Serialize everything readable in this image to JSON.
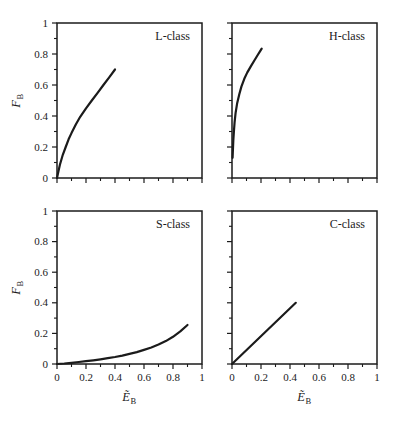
{
  "figure": {
    "background": "#ffffff",
    "ink_color": "#1b1b1b",
    "axis": {
      "x_letter": "Ẽ",
      "x_sub": "B",
      "y_letter": "F",
      "y_sub": "B"
    },
    "tick_values": [
      0,
      0.2,
      0.4,
      0.6,
      0.8,
      1
    ],
    "tick_labels": [
      "0",
      "0.2",
      "0.4",
      "0.6",
      "0.8",
      "1"
    ],
    "minor_tick_step": 0.1
  },
  "chart_data": [
    {
      "type": "line",
      "label": "L-class",
      "position": "top-left",
      "xlabel": "Ẽ_B",
      "ylabel": "F_B",
      "xlim": [
        0,
        1
      ],
      "ylim": [
        0,
        1
      ],
      "show_x_tick_labels": false,
      "show_y_tick_labels": true,
      "grid": false,
      "points": [
        [
          0,
          0
        ],
        [
          0.01,
          0.045
        ],
        [
          0.02,
          0.085
        ],
        [
          0.04,
          0.15
        ],
        [
          0.06,
          0.2
        ],
        [
          0.08,
          0.25
        ],
        [
          0.1,
          0.29
        ],
        [
          0.13,
          0.345
        ],
        [
          0.16,
          0.395
        ],
        [
          0.2,
          0.45
        ],
        [
          0.24,
          0.5
        ],
        [
          0.28,
          0.55
        ],
        [
          0.32,
          0.6
        ],
        [
          0.36,
          0.65
        ],
        [
          0.4,
          0.7
        ]
      ]
    },
    {
      "type": "line",
      "label": "H-class",
      "position": "top-right",
      "xlabel": "Ẽ_B",
      "ylabel": "F_B",
      "xlim": [
        0,
        1
      ],
      "ylim": [
        0,
        1
      ],
      "show_x_tick_labels": false,
      "show_y_tick_labels": false,
      "grid": false,
      "points": [
        [
          0.004,
          0.13
        ],
        [
          0.006,
          0.18
        ],
        [
          0.009,
          0.24
        ],
        [
          0.013,
          0.3
        ],
        [
          0.018,
          0.36
        ],
        [
          0.025,
          0.42
        ],
        [
          0.035,
          0.48
        ],
        [
          0.05,
          0.54
        ],
        [
          0.065,
          0.59
        ],
        [
          0.085,
          0.64
        ],
        [
          0.105,
          0.68
        ],
        [
          0.13,
          0.72
        ],
        [
          0.155,
          0.76
        ],
        [
          0.175,
          0.79
        ],
        [
          0.195,
          0.82
        ],
        [
          0.205,
          0.835
        ]
      ]
    },
    {
      "type": "line",
      "label": "S-class",
      "position": "bottom-left",
      "xlabel": "Ẽ_B",
      "ylabel": "F_B",
      "xlim": [
        0,
        1
      ],
      "ylim": [
        0,
        1
      ],
      "show_x_tick_labels": true,
      "show_y_tick_labels": true,
      "grid": false,
      "points": [
        [
          0,
          0
        ],
        [
          0.05,
          0.003
        ],
        [
          0.1,
          0.008
        ],
        [
          0.15,
          0.013
        ],
        [
          0.2,
          0.018
        ],
        [
          0.25,
          0.024
        ],
        [
          0.3,
          0.031
        ],
        [
          0.35,
          0.038
        ],
        [
          0.4,
          0.046
        ],
        [
          0.45,
          0.055
        ],
        [
          0.5,
          0.066
        ],
        [
          0.55,
          0.078
        ],
        [
          0.6,
          0.092
        ],
        [
          0.65,
          0.108
        ],
        [
          0.7,
          0.127
        ],
        [
          0.75,
          0.15
        ],
        [
          0.8,
          0.178
        ],
        [
          0.85,
          0.213
        ],
        [
          0.9,
          0.255
        ]
      ]
    },
    {
      "type": "line",
      "label": "C-class",
      "position": "bottom-right",
      "xlabel": "Ẽ_B",
      "ylabel": "F_B",
      "xlim": [
        0,
        1
      ],
      "ylim": [
        0,
        1
      ],
      "show_x_tick_labels": true,
      "show_y_tick_labels": false,
      "grid": false,
      "points": [
        [
          0,
          0
        ],
        [
          0.44,
          0.4
        ]
      ]
    }
  ]
}
